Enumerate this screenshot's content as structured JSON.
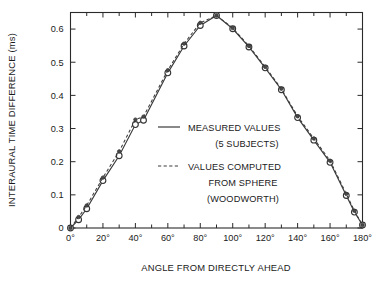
{
  "chart_data": {
    "type": "line",
    "title": "",
    "xlabel": "ANGLE FROM DIRECTLY AHEAD",
    "ylabel": "INTERAURAL TIME DIFFERENCE (ms)",
    "xlim": [
      0,
      180
    ],
    "ylim": [
      0,
      0.65
    ],
    "grid": false,
    "legend_position": "center",
    "x_tick_labels": [
      "0°",
      "20°",
      "40°",
      "60°",
      "80°",
      "100°",
      "120°",
      "140°",
      "160°",
      "180°"
    ],
    "x_tick_values": [
      0,
      20,
      40,
      60,
      80,
      100,
      120,
      140,
      160,
      180
    ],
    "x_minor_tick_values": [
      10,
      30,
      50,
      70,
      90,
      110,
      130,
      150,
      170
    ],
    "y_tick_labels": [
      "0",
      "0.1",
      "0.2",
      "0.3",
      "0.4",
      "0.5",
      "0.6"
    ],
    "y_tick_values": [
      0,
      0.1,
      0.2,
      0.3,
      0.4,
      0.5,
      0.6
    ],
    "series": [
      {
        "name": "MEASURED VALUES (5 SUBJECTS)",
        "style": "solid",
        "marker": "open-circle",
        "x": [
          0,
          5,
          10,
          20,
          30,
          40,
          45,
          60,
          70,
          80,
          90,
          100,
          110,
          120,
          130,
          140,
          150,
          160,
          170,
          175,
          180
        ],
        "y": [
          0.0,
          0.025,
          0.058,
          0.143,
          0.218,
          0.312,
          0.325,
          0.468,
          0.549,
          0.611,
          0.641,
          0.601,
          0.546,
          0.483,
          0.417,
          0.333,
          0.265,
          0.198,
          0.098,
          0.048,
          0.009
        ]
      },
      {
        "name": "VALUES COMPUTED FROM SPHERE (WOODWORTH)",
        "style": "dashed",
        "marker": "filled-circle",
        "x": [
          0,
          5,
          10,
          20,
          30,
          40,
          45,
          60,
          70,
          80,
          90,
          100,
          110,
          120,
          130,
          140,
          150,
          160,
          170,
          175,
          180
        ],
        "y": [
          0.0,
          0.033,
          0.068,
          0.152,
          0.231,
          0.327,
          0.336,
          0.476,
          0.556,
          0.619,
          0.641,
          0.603,
          0.549,
          0.486,
          0.42,
          0.337,
          0.27,
          0.203,
          0.103,
          0.052,
          0.009
        ]
      }
    ]
  },
  "legend": {
    "entries": [
      {
        "style": "solid",
        "lines": [
          "MEASURED VALUES",
          "(5 SUBJECTS)"
        ]
      },
      {
        "style": "dashed",
        "lines": [
          "VALUES COMPUTED",
          "FROM SPHERE",
          "(WOODWORTH)"
        ]
      }
    ],
    "line1": "MEASURED VALUES",
    "line2": "(5 SUBJECTS)",
    "line3": "VALUES COMPUTED",
    "line4": "FROM SPHERE",
    "line5": "(WOODWORTH)"
  },
  "colors": {
    "line": "#3a3a3a",
    "axis": "#2a2a2a",
    "text": "#1a1a1a",
    "background": "#ffffff",
    "marker_fill_open": "#ffffff",
    "marker_fill_closed": "#4a4a4a"
  }
}
